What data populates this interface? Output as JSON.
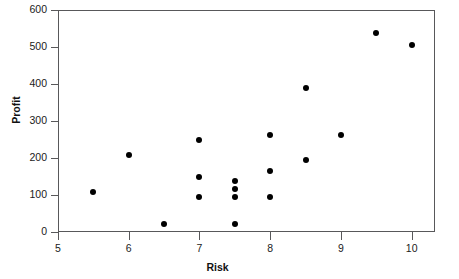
{
  "chart_data": {
    "type": "scatter",
    "title": "",
    "xlabel": "Risk",
    "ylabel": "Profit",
    "xlim": [
      5,
      10.33
    ],
    "ylim": [
      0,
      600
    ],
    "xticks": [
      5,
      6,
      7,
      8,
      9,
      10
    ],
    "xticklabels": [
      "5",
      "6",
      "7",
      "8",
      "9",
      "10"
    ],
    "yticks": [
      0,
      100,
      200,
      300,
      400,
      500,
      600
    ],
    "yticklabels": [
      "0",
      "100",
      "200",
      "300",
      "400",
      "500",
      "600"
    ],
    "grid": false,
    "legend": null,
    "marker": {
      "shape": "circle",
      "color": "#000000",
      "size_px": 6
    },
    "frame_color": "#58585a",
    "background": "#ffffff",
    "n_points": 17,
    "points": [
      {
        "x": 5.5,
        "y": 108
      },
      {
        "x": 6.0,
        "y": 208
      },
      {
        "x": 6.5,
        "y": 22
      },
      {
        "x": 7.0,
        "y": 249
      },
      {
        "x": 7.0,
        "y": 149
      },
      {
        "x": 7.0,
        "y": 95
      },
      {
        "x": 7.5,
        "y": 138
      },
      {
        "x": 7.5,
        "y": 116
      },
      {
        "x": 7.5,
        "y": 95
      },
      {
        "x": 7.5,
        "y": 22
      },
      {
        "x": 8.0,
        "y": 262
      },
      {
        "x": 8.0,
        "y": 165
      },
      {
        "x": 8.0,
        "y": 95
      },
      {
        "x": 8.5,
        "y": 389
      },
      {
        "x": 8.5,
        "y": 195
      },
      {
        "x": 9.0,
        "y": 262
      },
      {
        "x": 9.5,
        "y": 538
      },
      {
        "x": 10.0,
        "y": 505
      }
    ]
  }
}
